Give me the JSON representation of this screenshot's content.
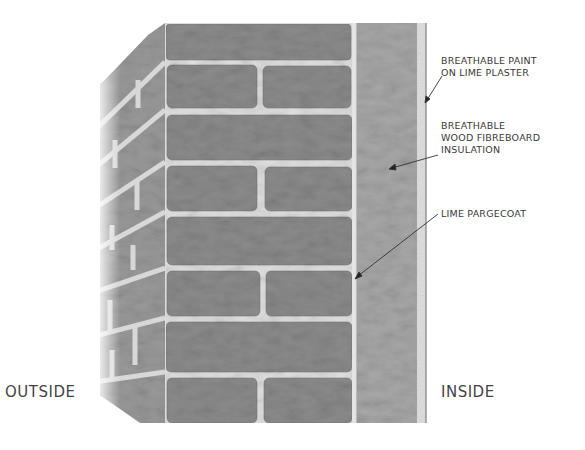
{
  "diagram": {
    "side_labels": {
      "outside": "OUTSIDE",
      "inside": "INSIDE"
    },
    "callouts": [
      {
        "id": "paint",
        "lines": [
          "BREATHABLE PAINT",
          "ON LIME PLASTER"
        ]
      },
      {
        "id": "insulation",
        "lines": [
          "BREATHABLE",
          "WOOD FIBREBOARD",
          "INSULATION"
        ]
      },
      {
        "id": "pargecoat",
        "lines": [
          "LIME PARGECOAT"
        ]
      }
    ],
    "layers": [
      {
        "name": "Solid brick wall",
        "color": "#8e8e8e"
      },
      {
        "name": "Lime pargecoat",
        "color": "#e6e6e6"
      },
      {
        "name": "Wood fibreboard insulation",
        "color": "#a9a9a9"
      },
      {
        "name": "Lime plaster with breathable paint",
        "color": "#dcdcdc"
      }
    ],
    "colors": {
      "brick": "#8c8c8c",
      "brick_dark": "#6e6e6e",
      "mortar": "#dedede",
      "insulation": "#a6a6a6",
      "plaster": "#e2e2e2",
      "text": "#3a3a3a"
    }
  }
}
